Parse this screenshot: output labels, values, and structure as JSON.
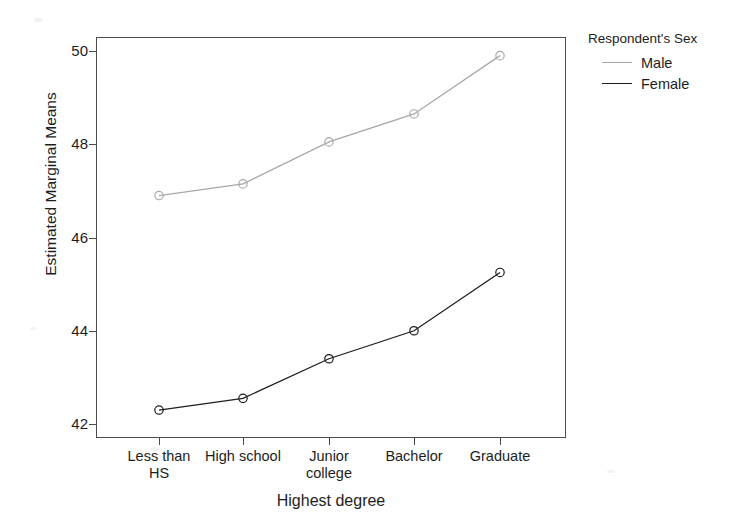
{
  "chart_data": {
    "type": "line",
    "title": "",
    "xlabel": "Highest degree",
    "ylabel": "Estimated Marginal Means",
    "categories": [
      "Less than HS",
      "High school",
      "Junior college",
      "Bachelor",
      "Graduate"
    ],
    "category_lines": [
      [
        "Less than",
        "HS"
      ],
      [
        "High school",
        ""
      ],
      [
        "Junior",
        "college"
      ],
      [
        "Bachelor",
        ""
      ],
      [
        "Graduate",
        ""
      ]
    ],
    "series": [
      {
        "name": "Male",
        "color": "#a8a8a8",
        "marker": "open-circle",
        "values": [
          46.9,
          47.15,
          48.05,
          48.65,
          49.9
        ]
      },
      {
        "name": "Female",
        "color": "#1e1e1e",
        "marker": "open-circle",
        "values": [
          42.3,
          42.55,
          43.4,
          44.0,
          45.25
        ]
      }
    ],
    "ylim": [
      41.7,
      50.3
    ],
    "yticks": [
      42,
      44,
      46,
      48,
      50
    ],
    "ytick_labels": [
      "42",
      "44",
      "46",
      "48",
      "50"
    ],
    "grid": false,
    "legend": {
      "title": "Respondent's Sex",
      "position": "right",
      "entries": [
        "Male",
        "Female"
      ]
    }
  },
  "axes": {
    "y_title": "Estimated Marginal Means",
    "x_title": "Highest degree",
    "y_labels": [
      "50",
      "48",
      "46",
      "44",
      "42"
    ]
  },
  "legend": {
    "title": "Respondent's Sex",
    "items": [
      {
        "label": "Male",
        "color": "#a8a8a8"
      },
      {
        "label": "Female",
        "color": "#1e1e1e"
      }
    ]
  },
  "xaxis": {
    "ticks": [
      {
        "line1": "Less than",
        "line2": "HS"
      },
      {
        "line1": "High school",
        "line2": ""
      },
      {
        "line1": "Junior",
        "line2": "college"
      },
      {
        "line1": "Bachelor",
        "line2": ""
      },
      {
        "line1": "Graduate",
        "line2": ""
      }
    ]
  }
}
